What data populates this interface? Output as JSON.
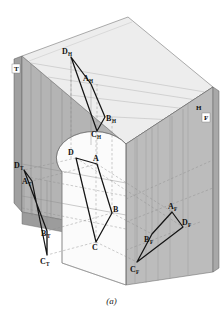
{
  "figure": {
    "caption": "(a)",
    "type": "descriptive-geometry-projection-box"
  },
  "planes": [
    {
      "key": "profile",
      "label": "T",
      "fill": "#b0b0b0",
      "x": 14,
      "y": 70
    },
    {
      "key": "horizontal",
      "label": "H",
      "fill": "#ededed",
      "x": 199,
      "y": 107
    },
    {
      "key": "frontal",
      "label": "F",
      "fill": "#b6b6b6",
      "x": 205,
      "y": 119
    }
  ],
  "object_points": [
    {
      "id": "D",
      "label": "D",
      "sub": "",
      "x": 76,
      "y": 158,
      "lx": 70,
      "ly": 156
    },
    {
      "id": "A",
      "label": "A",
      "sub": "",
      "x": 97,
      "y": 164,
      "lx": 93,
      "ly": 162
    },
    {
      "id": "B",
      "label": "B",
      "sub": "",
      "x": 112,
      "y": 213,
      "lx": 113,
      "ly": 212
    },
    {
      "id": "C",
      "label": "C",
      "sub": "",
      "x": 96,
      "y": 242,
      "lx": 94,
      "ly": 248
    }
  ],
  "horizontal_projection": [
    {
      "id": "DH",
      "label": "D",
      "sub": "H",
      "x": 71,
      "y": 57,
      "lx": 63,
      "ly": 55
    },
    {
      "id": "AH",
      "label": "A",
      "sub": "H",
      "x": 91,
      "y": 84,
      "lx": 84,
      "ly": 82
    },
    {
      "id": "BH",
      "label": "B",
      "sub": "H",
      "x": 105,
      "y": 117,
      "lx": 106,
      "ly": 120
    },
    {
      "id": "CH",
      "label": "C",
      "sub": "H",
      "x": 97,
      "y": 131,
      "lx": 92,
      "ly": 136
    }
  ],
  "frontal_projection": [
    {
      "id": "AF",
      "label": "A",
      "sub": "F",
      "x": 172,
      "y": 212,
      "lx": 171,
      "ly": 210
    },
    {
      "id": "DF",
      "label": "D",
      "sub": "F",
      "x": 183,
      "y": 227,
      "lx": 183,
      "ly": 226
    },
    {
      "id": "BF",
      "label": "B",
      "sub": "F",
      "x": 152,
      "y": 234,
      "lx": 147,
      "ly": 240
    },
    {
      "id": "CF",
      "label": "C",
      "sub": "F",
      "x": 137,
      "y": 262,
      "lx": 133,
      "ly": 270
    }
  ],
  "profile_projection": [
    {
      "id": "DT",
      "label": "D",
      "sub": "T",
      "x": 24,
      "y": 170,
      "lx": 16,
      "ly": 170
    },
    {
      "id": "AT",
      "label": "A",
      "sub": "T",
      "x": 32,
      "y": 181,
      "lx": 24,
      "ly": 183
    },
    {
      "id": "BT",
      "label": "B",
      "sub": "T",
      "x": 47,
      "y": 231,
      "lx": 43,
      "ly": 234
    },
    {
      "id": "CT",
      "label": "C",
      "sub": "T",
      "x": 47,
      "y": 255,
      "lx": 43,
      "ly": 262
    }
  ],
  "colors": {
    "horizontal_plane": "#ededed",
    "frontal_plane": "#b6b6b6",
    "profile_plane": "#b0b0b0",
    "profile_plane_dark": "#a3a3a3",
    "cylinder_face": "#fbfbfb",
    "line": "#1a1a1a",
    "thin_line": "#8e8e8e",
    "dashed_line": "#9a9a9a"
  }
}
